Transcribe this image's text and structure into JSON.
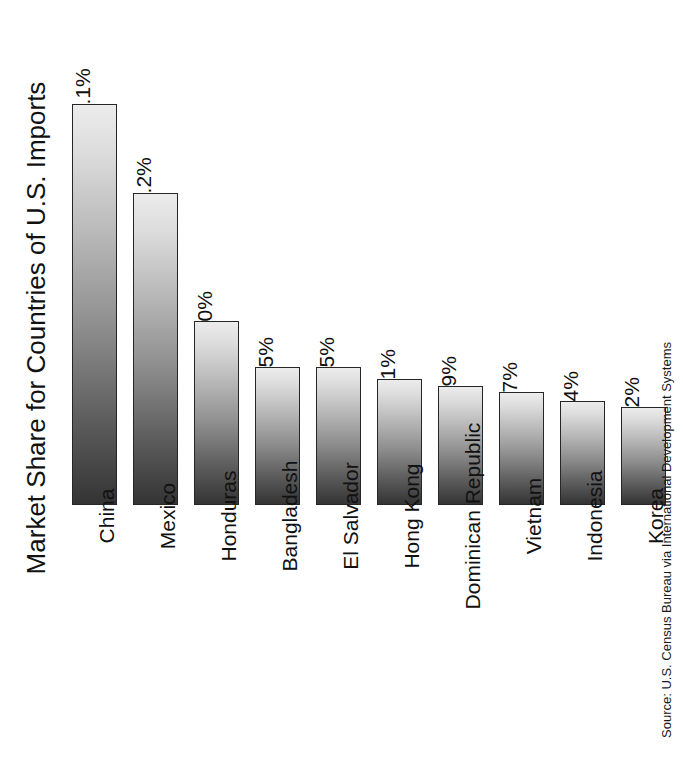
{
  "chart_data": {
    "type": "bar",
    "title": "Market Share for Countries of U.S. Imports",
    "xlabel": "",
    "ylabel": "Market Share for Countries of U.S. Imports",
    "categories": [
      "China",
      "Mexico",
      "Honduras",
      "Bangladesh",
      "El Salvador",
      "Hong Kong",
      "Dominican Republic",
      "Vietnam",
      "Indonesia",
      "Korea"
    ],
    "values": [
      13.1,
      10.2,
      6.0,
      4.5,
      4.5,
      4.1,
      3.9,
      3.7,
      3.4,
      3.2
    ],
    "value_labels": [
      "13.1%",
      "10.2%",
      "6.0%",
      "4.5%",
      "4.5%",
      "4.1%",
      "3.9%",
      "3.7%",
      "3.4%",
      "3.2%"
    ],
    "ylim": [
      0,
      13.1
    ],
    "grid": false,
    "legend": null,
    "axis_visible": false,
    "orientation": "vertical",
    "label_rotation_deg": -90,
    "bar_style": {
      "fill": "vertical-gradient light-to-dark",
      "gradient_top": "#ececec",
      "gradient_bottom": "#343434",
      "border": "#262626"
    },
    "annotations": [
      "Source: U.S. Census Bureau via International Development Systems"
    ]
  },
  "source_note": "Source: U.S. Census Bureau via International Development Systems",
  "colors": {
    "background": "#ffffff",
    "text": "#111111",
    "bar_light": "#ececec",
    "bar_dark": "#343434",
    "bar_border": "#262626"
  }
}
